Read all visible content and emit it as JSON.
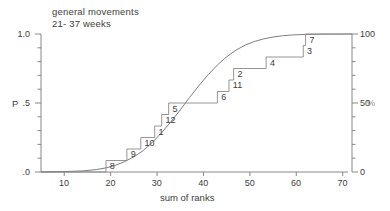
{
  "chart_data": {
    "type": "line",
    "title": "general movements",
    "subtitle": "21- 37 weeks",
    "xlabel": "sum of ranks",
    "ylabel": "P",
    "ylabel_right": "%",
    "xlim": [
      5,
      72
    ],
    "ylim": [
      0.0,
      1.0
    ],
    "grid": false,
    "legend": "none",
    "xticks": [
      10,
      20,
      30,
      40,
      50,
      60,
      70
    ],
    "xtick_labels": [
      "10",
      "20",
      "30",
      "40",
      "50",
      "60",
      "70"
    ],
    "yticks_left": [
      0.0,
      0.5,
      1.0
    ],
    "ytick_labels_left": [
      ".0",
      ".5",
      "1.0"
    ],
    "yticks_right": [
      0,
      50,
      100
    ],
    "ytick_labels_right": [
      "0",
      "50",
      "100"
    ],
    "series": [
      {
        "name": "theoretical normal cumulative distribution",
        "type": "line",
        "x": [
          5,
          10,
          14,
          17,
          19,
          21,
          23,
          25,
          27,
          29,
          31,
          33,
          35,
          37,
          39,
          41,
          43,
          45,
          47,
          49,
          51,
          53,
          55,
          57,
          59,
          62,
          66,
          72
        ],
        "y": [
          0.0,
          0.003,
          0.008,
          0.018,
          0.03,
          0.048,
          0.075,
          0.11,
          0.155,
          0.215,
          0.285,
          0.365,
          0.45,
          0.54,
          0.625,
          0.705,
          0.775,
          0.835,
          0.883,
          0.92,
          0.946,
          0.965,
          0.978,
          0.987,
          0.993,
          0.997,
          0.999,
          1.0
        ]
      },
      {
        "name": "empirical cumulative step function",
        "type": "step",
        "x": [
          5,
          19,
          23.5,
          26.5,
          29.5,
          31,
          32.5,
          43,
          45.5,
          46.5,
          53.5,
          61.5,
          62,
          72
        ],
        "y": [
          0.0,
          0.0833,
          0.1667,
          0.25,
          0.3333,
          0.4167,
          0.5,
          0.5833,
          0.6667,
          0.75,
          0.8333,
          0.9167,
          1.0,
          1.0
        ]
      }
    ],
    "step_labels": [
      {
        "label": "8",
        "x": 19.5,
        "y": 0.0833
      },
      {
        "label": "9",
        "x": 24.0,
        "y": 0.1667
      },
      {
        "label": "10",
        "x": 27.0,
        "y": 0.25
      },
      {
        "label": "1",
        "x": 30.0,
        "y": 0.3333
      },
      {
        "label": "12",
        "x": 31.5,
        "y": 0.4167
      },
      {
        "label": "5",
        "x": 33.0,
        "y": 0.5
      },
      {
        "label": "6",
        "x": 43.5,
        "y": 0.5833
      },
      {
        "label": "11",
        "x": 46.0,
        "y": 0.6667
      },
      {
        "label": "2",
        "x": 47.0,
        "y": 0.75
      },
      {
        "label": "4",
        "x": 54.0,
        "y": 0.8333
      },
      {
        "label": "3",
        "x": 62.0,
        "y": 0.9167
      },
      {
        "label": "7",
        "x": 62.5,
        "y": 1.0
      }
    ],
    "colors": {
      "ink": "#3a3a3a",
      "axis": "#7a7a7a",
      "curve": "#6e6e6e",
      "step": "#8a8a8a",
      "background": "#ffffff",
      "percent_label": "#8d8d8d"
    }
  }
}
